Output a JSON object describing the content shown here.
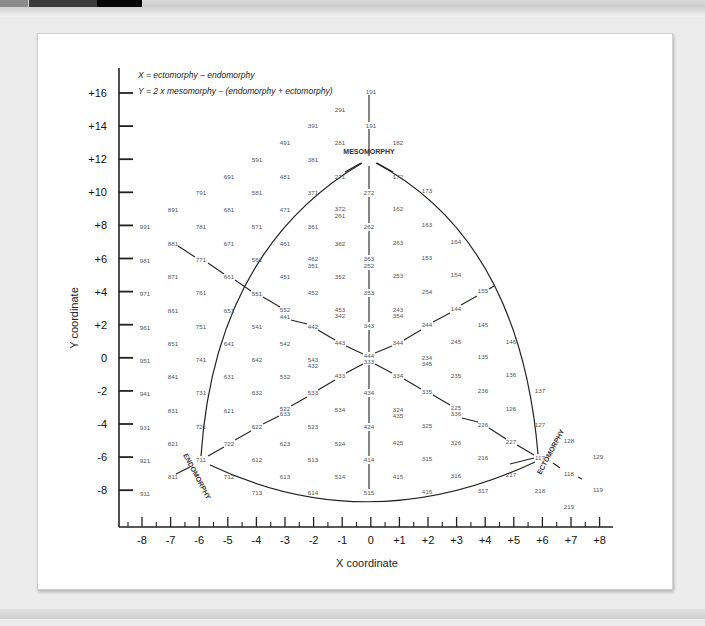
{
  "formulas": {
    "x": "X = ectomorphy – endomorphy",
    "y": "Y = 2 x mesomorphy – (endomorphy + ectomorphy)"
  },
  "axes": {
    "x_title": "X coordinate",
    "y_title": "Y coordinate",
    "x_ticks": [
      "-8",
      "-7",
      "-6",
      "-5",
      "-4",
      "-3",
      "-2",
      "-1",
      "0",
      "+1",
      "+2",
      "+3",
      "+4",
      "+5",
      "+6",
      "+7",
      "+8"
    ],
    "y_ticks": [
      "+16",
      "+14",
      "+12",
      "+10",
      "+8",
      "+6",
      "+4",
      "+2",
      "0",
      "-2",
      "-4",
      "-6",
      "-8"
    ]
  },
  "regions": {
    "mesomorphy": "MESOMORPHY",
    "endomorphy": "ENDOMORPHY",
    "ectomorphy": "ECTOMORPHY"
  },
  "colors": {
    "line": "#222222",
    "label": "#555555",
    "frame_bg": "#ffffff",
    "page_bg": "#ececec"
  },
  "chart_data": {
    "type": "scatter",
    "xlabel": "X coordinate",
    "ylabel": "Y coordinate",
    "xlim": [
      -8,
      8
    ],
    "ylim": [
      -8,
      16
    ],
    "grid": false,
    "annotations": [
      "X = ectomorphy – endomorphy",
      "Y = 2 x mesomorphy – (endomorphy + ectomorphy)",
      "MESOMORPHY",
      "ENDOMORPHY",
      "ECTOMORPHY"
    ],
    "somatotype_labels": [
      {
        "t": "191",
        "x": 371,
        "y": 92
      },
      {
        "t": "291",
        "x": 340,
        "y": 110
      },
      {
        "t": "391",
        "x": 313,
        "y": 126
      },
      {
        "t": "191",
        "x": 371,
        "y": 126
      },
      {
        "t": "491",
        "x": 285,
        "y": 143
      },
      {
        "t": "281",
        "x": 340,
        "y": 143
      },
      {
        "t": "182",
        "x": 398,
        "y": 143
      },
      {
        "t": "591",
        "x": 257,
        "y": 160
      },
      {
        "t": "381",
        "x": 313,
        "y": 160
      },
      {
        "t": "691",
        "x": 229,
        "y": 177
      },
      {
        "t": "481",
        "x": 285,
        "y": 177
      },
      {
        "t": "271",
        "x": 340,
        "y": 177
      },
      {
        "t": "172",
        "x": 398,
        "y": 177
      },
      {
        "t": "791",
        "x": 201,
        "y": 193
      },
      {
        "t": "581",
        "x": 257,
        "y": 193
      },
      {
        "t": "371",
        "x": 313,
        "y": 193
      },
      {
        "t": "272",
        "x": 369,
        "y": 193
      },
      {
        "t": "173",
        "x": 427,
        "y": 191
      },
      {
        "t": "891",
        "x": 173,
        "y": 210
      },
      {
        "t": "681",
        "x": 229,
        "y": 210
      },
      {
        "t": "471",
        "x": 285,
        "y": 210
      },
      {
        "t": "372",
        "x": 340,
        "y": 209
      },
      {
        "t": "261",
        "x": 340,
        "y": 216
      },
      {
        "t": "162",
        "x": 398,
        "y": 209
      },
      {
        "t": "991",
        "x": 145,
        "y": 227
      },
      {
        "t": "781",
        "x": 201,
        "y": 227
      },
      {
        "t": "571",
        "x": 257,
        "y": 227
      },
      {
        "t": "361",
        "x": 313,
        "y": 227
      },
      {
        "t": "262",
        "x": 369,
        "y": 227
      },
      {
        "t": "163",
        "x": 427,
        "y": 225
      },
      {
        "t": "881",
        "x": 173,
        "y": 244
      },
      {
        "t": "671",
        "x": 229,
        "y": 244
      },
      {
        "t": "461",
        "x": 285,
        "y": 244
      },
      {
        "t": "362",
        "x": 340,
        "y": 244
      },
      {
        "t": "263",
        "x": 398,
        "y": 243
      },
      {
        "t": "164",
        "x": 456,
        "y": 242
      },
      {
        "t": "981",
        "x": 145,
        "y": 261
      },
      {
        "t": "771",
        "x": 201,
        "y": 260
      },
      {
        "t": "561",
        "x": 257,
        "y": 260
      },
      {
        "t": "462",
        "x": 313,
        "y": 259
      },
      {
        "t": "351",
        "x": 313,
        "y": 266
      },
      {
        "t": "363",
        "x": 369,
        "y": 259
      },
      {
        "t": "252",
        "x": 369,
        "y": 266
      },
      {
        "t": "153",
        "x": 427,
        "y": 258
      },
      {
        "t": "871",
        "x": 173,
        "y": 277
      },
      {
        "t": "661",
        "x": 229,
        "y": 277
      },
      {
        "t": "451",
        "x": 285,
        "y": 277
      },
      {
        "t": "352",
        "x": 340,
        "y": 277
      },
      {
        "t": "253",
        "x": 398,
        "y": 276
      },
      {
        "t": "154",
        "x": 456,
        "y": 275
      },
      {
        "t": "971",
        "x": 145,
        "y": 294
      },
      {
        "t": "761",
        "x": 201,
        "y": 293
      },
      {
        "t": "551",
        "x": 257,
        "y": 294
      },
      {
        "t": "452",
        "x": 313,
        "y": 293
      },
      {
        "t": "353",
        "x": 369,
        "y": 293
      },
      {
        "t": "254",
        "x": 427,
        "y": 292
      },
      {
        "t": "155",
        "x": 483,
        "y": 291
      },
      {
        "t": "861",
        "x": 173,
        "y": 311
      },
      {
        "t": "651",
        "x": 229,
        "y": 311
      },
      {
        "t": "552",
        "x": 285,
        "y": 310
      },
      {
        "t": "441",
        "x": 285,
        "y": 317
      },
      {
        "t": "453",
        "x": 340,
        "y": 310
      },
      {
        "t": "342",
        "x": 340,
        "y": 316
      },
      {
        "t": "243",
        "x": 398,
        "y": 310
      },
      {
        "t": "354",
        "x": 398,
        "y": 316
      },
      {
        "t": "144",
        "x": 456,
        "y": 309
      },
      {
        "t": "961",
        "x": 145,
        "y": 328
      },
      {
        "t": "751",
        "x": 201,
        "y": 327
      },
      {
        "t": "541",
        "x": 257,
        "y": 327
      },
      {
        "t": "442",
        "x": 313,
        "y": 327
      },
      {
        "t": "343",
        "x": 369,
        "y": 326
      },
      {
        "t": "244",
        "x": 427,
        "y": 325
      },
      {
        "t": "145",
        "x": 483,
        "y": 325
      },
      {
        "t": "851",
        "x": 173,
        "y": 344
      },
      {
        "t": "641",
        "x": 229,
        "y": 344
      },
      {
        "t": "542",
        "x": 285,
        "y": 344
      },
      {
        "t": "443",
        "x": 340,
        "y": 343
      },
      {
        "t": "344",
        "x": 398,
        "y": 343
      },
      {
        "t": "245",
        "x": 456,
        "y": 342
      },
      {
        "t": "146",
        "x": 511,
        "y": 342
      },
      {
        "t": "951",
        "x": 145,
        "y": 361
      },
      {
        "t": "741",
        "x": 201,
        "y": 360
      },
      {
        "t": "642",
        "x": 257,
        "y": 360
      },
      {
        "t": "543",
        "x": 313,
        "y": 360
      },
      {
        "t": "432",
        "x": 313,
        "y": 366
      },
      {
        "t": "444",
        "x": 369,
        "y": 356
      },
      {
        "t": "333",
        "x": 369,
        "y": 362
      },
      {
        "t": "234",
        "x": 427,
        "y": 358
      },
      {
        "t": "345",
        "x": 427,
        "y": 364
      },
      {
        "t": "135",
        "x": 483,
        "y": 357
      },
      {
        "t": "841",
        "x": 173,
        "y": 377
      },
      {
        "t": "631",
        "x": 229,
        "y": 377
      },
      {
        "t": "532",
        "x": 285,
        "y": 377
      },
      {
        "t": "433",
        "x": 340,
        "y": 376
      },
      {
        "t": "334",
        "x": 398,
        "y": 376
      },
      {
        "t": "235",
        "x": 456,
        "y": 376
      },
      {
        "t": "136",
        "x": 511,
        "y": 375
      },
      {
        "t": "941",
        "x": 145,
        "y": 394
      },
      {
        "t": "731",
        "x": 201,
        "y": 393
      },
      {
        "t": "632",
        "x": 257,
        "y": 393
      },
      {
        "t": "533",
        "x": 313,
        "y": 393
      },
      {
        "t": "434",
        "x": 369,
        "y": 393
      },
      {
        "t": "335",
        "x": 427,
        "y": 392
      },
      {
        "t": "236",
        "x": 483,
        "y": 391
      },
      {
        "t": "137",
        "x": 540,
        "y": 391
      },
      {
        "t": "831",
        "x": 173,
        "y": 411
      },
      {
        "t": "621",
        "x": 229,
        "y": 411
      },
      {
        "t": "522",
        "x": 285,
        "y": 409
      },
      {
        "t": "633",
        "x": 285,
        "y": 414
      },
      {
        "t": "534",
        "x": 340,
        "y": 410
      },
      {
        "t": "324",
        "x": 398,
        "y": 410
      },
      {
        "t": "435",
        "x": 398,
        "y": 416
      },
      {
        "t": "225",
        "x": 456,
        "y": 408
      },
      {
        "t": "336",
        "x": 456,
        "y": 414
      },
      {
        "t": "126",
        "x": 511,
        "y": 409
      },
      {
        "t": "931",
        "x": 145,
        "y": 428
      },
      {
        "t": "721",
        "x": 201,
        "y": 427
      },
      {
        "t": "622",
        "x": 257,
        "y": 427
      },
      {
        "t": "523",
        "x": 313,
        "y": 427
      },
      {
        "t": "424",
        "x": 369,
        "y": 427
      },
      {
        "t": "325",
        "x": 427,
        "y": 426
      },
      {
        "t": "226",
        "x": 483,
        "y": 425
      },
      {
        "t": "127",
        "x": 540,
        "y": 425
      },
      {
        "t": "821",
        "x": 173,
        "y": 444
      },
      {
        "t": "722",
        "x": 229,
        "y": 444
      },
      {
        "t": "623",
        "x": 285,
        "y": 444
      },
      {
        "t": "524",
        "x": 340,
        "y": 444
      },
      {
        "t": "425",
        "x": 398,
        "y": 443
      },
      {
        "t": "326",
        "x": 456,
        "y": 443
      },
      {
        "t": "227",
        "x": 511,
        "y": 442
      },
      {
        "t": "128",
        "x": 569,
        "y": 441
      },
      {
        "t": "921",
        "x": 145,
        "y": 461
      },
      {
        "t": "711",
        "x": 201,
        "y": 460
      },
      {
        "t": "612",
        "x": 257,
        "y": 460
      },
      {
        "t": "513",
        "x": 313,
        "y": 460
      },
      {
        "t": "414",
        "x": 369,
        "y": 460
      },
      {
        "t": "315",
        "x": 427,
        "y": 459
      },
      {
        "t": "216",
        "x": 483,
        "y": 458
      },
      {
        "t": "117",
        "x": 540,
        "y": 458
      },
      {
        "t": "129",
        "x": 598,
        "y": 457
      },
      {
        "t": "811",
        "x": 173,
        "y": 477
      },
      {
        "t": "712",
        "x": 229,
        "y": 477
      },
      {
        "t": "613",
        "x": 285,
        "y": 477
      },
      {
        "t": "514",
        "x": 340,
        "y": 477
      },
      {
        "t": "415",
        "x": 398,
        "y": 477
      },
      {
        "t": "316",
        "x": 456,
        "y": 476
      },
      {
        "t": "217",
        "x": 511,
        "y": 475
      },
      {
        "t": "118",
        "x": 569,
        "y": 474
      },
      {
        "t": "911",
        "x": 145,
        "y": 494
      },
      {
        "t": "713",
        "x": 257,
        "y": 493
      },
      {
        "t": "614",
        "x": 313,
        "y": 493
      },
      {
        "t": "515",
        "x": 369,
        "y": 493
      },
      {
        "t": "416",
        "x": 427,
        "y": 492
      },
      {
        "t": "317",
        "x": 483,
        "y": 491
      },
      {
        "t": "218",
        "x": 540,
        "y": 491
      },
      {
        "t": "119",
        "x": 598,
        "y": 490
      },
      {
        "t": "219",
        "x": 569,
        "y": 507
      }
    ]
  }
}
